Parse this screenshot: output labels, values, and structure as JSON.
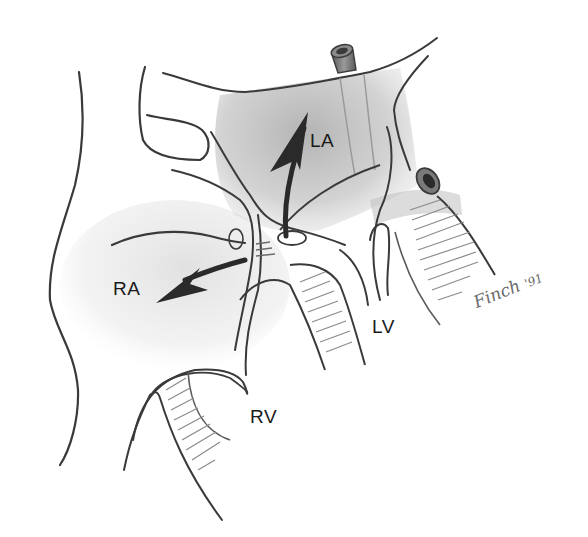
{
  "figure": {
    "type": "anatomical illustration",
    "labels": {
      "left_atrium": "LA",
      "right_atrium": "RA",
      "left_ventricle": "LV",
      "right_ventricle": "RV"
    },
    "arrows": [
      {
        "name": "flow-to-left-atrium",
        "direction": "up"
      },
      {
        "name": "flow-to-right-atrium",
        "direction": "left"
      }
    ],
    "signature": {
      "name": "Finch",
      "year": "'91"
    },
    "colors": {
      "outline": "#3a3a3a",
      "shading": "#bdbdbd",
      "arrow": "#2a2a2a",
      "label": "#1a1a1a"
    }
  }
}
